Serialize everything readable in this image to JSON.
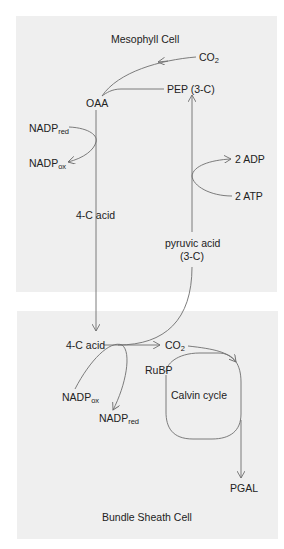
{
  "diagram": {
    "type": "C4 photosynthesis pathway",
    "colors": {
      "panel_bg": "#efefef",
      "line": "#6e6e6e",
      "text": "#222222",
      "page_bg": "#ffffff"
    },
    "mesophyll": {
      "title": "Mesophyll Cell",
      "co2": {
        "base": "CO",
        "sub": "2"
      },
      "pep": "PEP (3-C)",
      "oaa": "OAA",
      "nadp_red": {
        "base": "NADP",
        "sub": "red"
      },
      "nadp_ox": {
        "base": "NADP",
        "sub": "ox"
      },
      "adp": "2 ADP",
      "atp": "2 ATP",
      "four_c_acid": "4-C acid",
      "pyruvic_line1": "pyruvic acid",
      "pyruvic_line2": "(3-C)"
    },
    "bundle_sheath": {
      "title": "Bundle Sheath Cell",
      "four_c_acid": "4-C acid",
      "co2": {
        "base": "CO",
        "sub": "2"
      },
      "rubp": "RuBP",
      "calvin": "Calvin cycle",
      "nadp_ox": {
        "base": "NADP",
        "sub": "ox"
      },
      "nadp_red": {
        "base": "NADP",
        "sub": "red"
      },
      "pgal": "PGAL"
    },
    "edges": [
      {
        "from": "CO2 (mesophyll)",
        "to": "OAA"
      },
      {
        "from": "PEP (3-C)",
        "to": "OAA"
      },
      {
        "from": "OAA",
        "to": "4-C acid (bundle sheath)",
        "via": "4-C acid"
      },
      {
        "from": "NADPred",
        "to": "NADPox",
        "coupled_with": "OAA -> 4-C acid"
      },
      {
        "from": "4-C acid (bundle sheath)",
        "to": "CO2 (bundle sheath)"
      },
      {
        "from": "4-C acid (bundle sheath)",
        "to": "pyruvic acid (3-C)"
      },
      {
        "from": "NADPox",
        "to": "NADPred",
        "coupled_with": "4-C acid decarboxylation"
      },
      {
        "from": "pyruvic acid (3-C)",
        "to": "PEP (3-C)"
      },
      {
        "from": "2 ATP",
        "to": "2 ADP",
        "coupled_with": "pyruvic acid -> PEP"
      },
      {
        "from": "CO2 (bundle sheath)",
        "to": "Calvin cycle"
      },
      {
        "from": "Calvin cycle",
        "to": "PGAL"
      }
    ]
  }
}
